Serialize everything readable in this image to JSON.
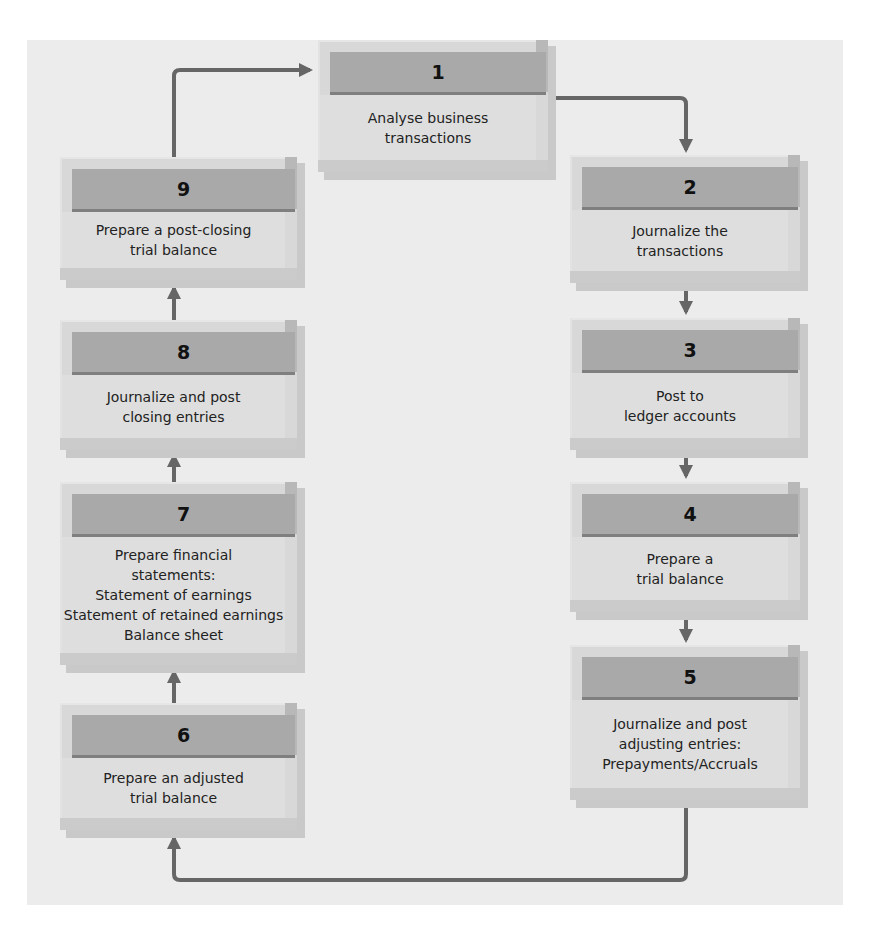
{
  "diagram": {
    "type": "accounting-cycle-flowchart",
    "colors": {
      "panel_background": "#ececec",
      "box_header": "#a9a9a9",
      "box_body": "#dedede",
      "arrow": "#666666"
    },
    "steps": [
      {
        "number": "1",
        "lines": [
          "Analyse business",
          "transactions"
        ]
      },
      {
        "number": "2",
        "lines": [
          "Journalize the",
          "transactions"
        ]
      },
      {
        "number": "3",
        "lines": [
          "Post to",
          "ledger accounts"
        ]
      },
      {
        "number": "4",
        "lines": [
          "Prepare a",
          "trial balance"
        ]
      },
      {
        "number": "5",
        "lines": [
          "Journalize and post",
          "adjusting entries:",
          "Prepayments/Accruals"
        ]
      },
      {
        "number": "6",
        "lines": [
          "Prepare an adjusted",
          "trial balance"
        ]
      },
      {
        "number": "7",
        "lines": [
          "Prepare financial",
          "statements:",
          "Statement of earnings",
          "Statement of retained earnings",
          "Balance sheet"
        ]
      },
      {
        "number": "8",
        "lines": [
          "Journalize and post",
          "closing entries"
        ]
      },
      {
        "number": "9",
        "lines": [
          "Prepare a post-closing",
          "trial balance"
        ]
      }
    ],
    "flow": [
      "1→2",
      "2→3",
      "3→4",
      "4→5",
      "5→6",
      "6→7",
      "7→8",
      "8→9",
      "9→1"
    ]
  }
}
